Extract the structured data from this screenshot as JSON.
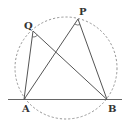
{
  "diagram": {
    "type": "geometry",
    "points": {
      "A": {
        "label": "A",
        "x": 24,
        "y": 99
      },
      "B": {
        "label": "B",
        "x": 107,
        "y": 99
      },
      "P": {
        "label": "P",
        "x": 78,
        "y": 19
      },
      "Q": {
        "label": "Q",
        "x": 33,
        "y": 31
      }
    },
    "circle": {
      "cx": 66,
      "cy": 68,
      "r": 51,
      "style": "dashed"
    },
    "segments": [
      "AQ",
      "QB",
      "AP",
      "PB"
    ],
    "line": {
      "through": [
        "A",
        "B"
      ],
      "extended": true
    },
    "angle_marks": [
      "AQB",
      "APB"
    ],
    "colors": {
      "line": "#555555",
      "circle": "#888888",
      "label": "#333333"
    }
  }
}
